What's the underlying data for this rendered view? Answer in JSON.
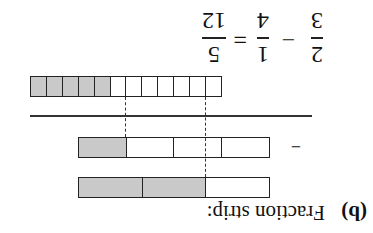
{
  "label": "(b)",
  "title": "Fraction strip:",
  "strips": {
    "thirds": {
      "cells": 3,
      "shaded": [
        1,
        2
      ]
    },
    "quarters": {
      "cells": 4,
      "shaded": [
        3
      ]
    },
    "twelfths": {
      "cells": 12,
      "shaded": [
        7,
        8,
        9,
        10,
        11
      ]
    }
  },
  "operator_minus": "−",
  "formula": {
    "a_num": "2",
    "a_den": "3",
    "op": "−",
    "b_num": "1",
    "b_den": "4",
    "eq": "=",
    "r_num": "5",
    "r_den": "12"
  },
  "colors": {
    "shade": "#c9c9c9",
    "line": "#222222"
  },
  "orientation": "rotated 180°"
}
